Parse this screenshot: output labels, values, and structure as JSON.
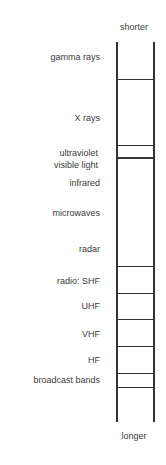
{
  "diagram": {
    "top_label": "shorter",
    "bottom_label": "longer",
    "bands": [
      {
        "label": "gamma rays",
        "y": 57
      },
      {
        "label": "X rays",
        "y": 118
      },
      {
        "label": "ultraviolet",
        "y": 136
      },
      {
        "label": "visible light",
        "y": 148
      },
      {
        "label": "infrared",
        "y": 178
      },
      {
        "label": "microwaves",
        "y": 208
      },
      {
        "label": "radar",
        "y": 244
      },
      {
        "label": "radio: SHF",
        "y": 276
      },
      {
        "label": "UHF",
        "y": 301
      },
      {
        "label": "VHF",
        "y": 329
      },
      {
        "label": "HF",
        "y": 355
      },
      {
        "label": "broadcast bands",
        "y": 377
      }
    ],
    "dividers_y": [
      79,
      145,
      158,
      266,
      293,
      319,
      346,
      373,
      387
    ]
  }
}
